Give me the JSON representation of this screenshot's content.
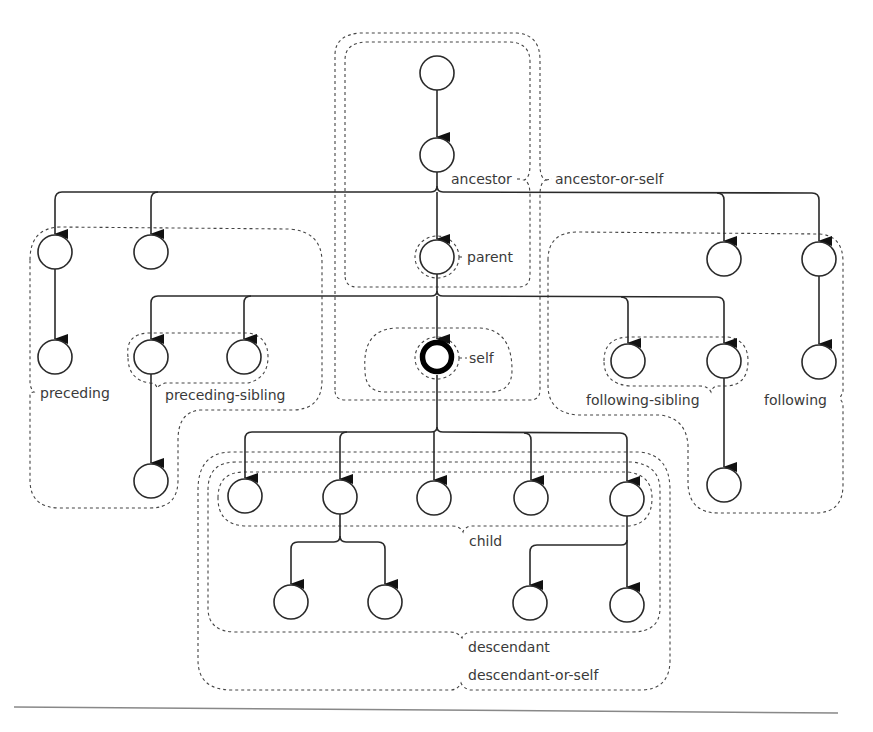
{
  "diagram": {
    "labels": {
      "ancestor": "ancestor",
      "ancestor_or_self": "ancestor-or-self",
      "parent": "parent",
      "self": "self",
      "preceding": "preceding",
      "preceding_sibling": "preceding-sibling",
      "following_sibling": "following-sibling",
      "following": "following",
      "child": "child",
      "descendant": "descendant",
      "descendant_or_self": "descendant-or-self"
    },
    "colors": {
      "stroke": "#2a2a2a",
      "region_stroke": "#444444",
      "label": "#3a3a3a",
      "background": "#ffffff"
    },
    "nodes": [
      {
        "id": "root",
        "x": 437,
        "y": 73
      },
      {
        "id": "grandparent",
        "x": 437,
        "y": 155
      },
      {
        "id": "parent",
        "x": 437,
        "y": 257
      },
      {
        "id": "self",
        "x": 437,
        "y": 357
      },
      {
        "id": "preceding-a",
        "x": 55,
        "y": 252
      },
      {
        "id": "preceding-b",
        "x": 151,
        "y": 252
      },
      {
        "id": "preceding-a-child",
        "x": 55,
        "y": 357
      },
      {
        "id": "preceding-sibling-1",
        "x": 151,
        "y": 357
      },
      {
        "id": "preceding-sibling-2",
        "x": 244,
        "y": 357
      },
      {
        "id": "preceding-sibling-1-child",
        "x": 151,
        "y": 481
      },
      {
        "id": "following-sibling-1",
        "x": 628,
        "y": 361
      },
      {
        "id": "following-sibling-2",
        "x": 724,
        "y": 361
      },
      {
        "id": "following-sibling-2-child",
        "x": 724,
        "y": 485
      },
      {
        "id": "following-a",
        "x": 724,
        "y": 259
      },
      {
        "id": "following-b",
        "x": 819,
        "y": 259
      },
      {
        "id": "following-b-child",
        "x": 819,
        "y": 362
      },
      {
        "id": "child-1",
        "x": 245,
        "y": 496
      },
      {
        "id": "child-2",
        "x": 340,
        "y": 497
      },
      {
        "id": "child-3",
        "x": 434,
        "y": 498
      },
      {
        "id": "child-4",
        "x": 531,
        "y": 498
      },
      {
        "id": "child-5",
        "x": 627,
        "y": 499
      },
      {
        "id": "grandchild-1",
        "x": 291,
        "y": 602
      },
      {
        "id": "grandchild-2",
        "x": 385,
        "y": 602
      },
      {
        "id": "grandchild-3",
        "x": 530,
        "y": 603
      },
      {
        "id": "grandchild-4",
        "x": 627,
        "y": 605
      }
    ]
  }
}
